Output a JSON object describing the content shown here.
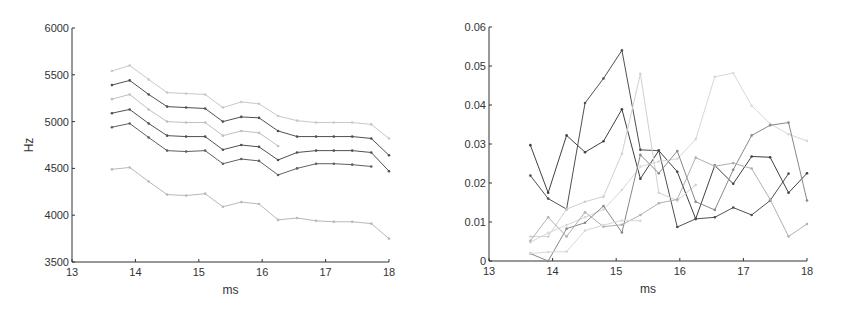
{
  "chart_data": [
    {
      "type": "line",
      "title": "",
      "xlabel": "ms",
      "ylabel": "Hz",
      "xlim": [
        13,
        18
      ],
      "ylim": [
        3500,
        6000
      ],
      "xticks": [
        13,
        14,
        15,
        16,
        17,
        18
      ],
      "yticks": [
        3500,
        4000,
        4500,
        5000,
        5500,
        6000
      ],
      "grid": false,
      "legend": null,
      "x": [
        13.63,
        13.91,
        14.21,
        14.5,
        14.8,
        15.1,
        15.38,
        15.67,
        15.95,
        16.25,
        16.55,
        16.85,
        17.13,
        17.42,
        17.72,
        18.0
      ],
      "series": [
        {
          "name": "series-1",
          "color": "#c8c8c8",
          "values": [
            5540,
            5600,
            5450,
            5310,
            5300,
            5290,
            5150,
            5210,
            5190,
            5060,
            5010,
            4990,
            4990,
            4990,
            4970,
            4820
          ]
        },
        {
          "name": "series-2",
          "color": "#505050",
          "values": [
            5390,
            5440,
            5290,
            5160,
            5150,
            5140,
            5000,
            5050,
            5040,
            4900,
            4840,
            4840,
            4840,
            4840,
            4820,
            4640
          ]
        },
        {
          "name": "series-3",
          "color": "#c0c0c0",
          "values": [
            5240,
            5290,
            5130,
            5000,
            4990,
            4990,
            4850,
            4900,
            4880,
            4740,
            null,
            null,
            null,
            null,
            null,
            null
          ]
        },
        {
          "name": "series-4",
          "color": "#505050",
          "values": [
            5090,
            5130,
            4980,
            4850,
            4840,
            4840,
            4700,
            4750,
            4730,
            4590,
            4670,
            4690,
            4690,
            4690,
            4670,
            4470
          ]
        },
        {
          "name": "series-5",
          "color": "#606060",
          "values": [
            4940,
            4980,
            4830,
            4690,
            4680,
            4690,
            4550,
            4600,
            4580,
            4430,
            4500,
            4550,
            4550,
            4540,
            4520,
            null
          ]
        },
        {
          "name": "series-6",
          "color": "#b8b8b8",
          "values": [
            4490,
            4510,
            4360,
            4220,
            4210,
            4230,
            4090,
            4140,
            4120,
            3950,
            3970,
            3940,
            3930,
            3930,
            3910,
            3750
          ]
        }
      ]
    },
    {
      "type": "line",
      "title": "",
      "xlabel": "ms",
      "ylabel": "",
      "xlim": [
        13,
        18
      ],
      "ylim": [
        0,
        0.06
      ],
      "xticks": [
        13,
        14,
        15,
        16,
        17,
        18
      ],
      "yticks": [
        0,
        0.01,
        0.02,
        0.03,
        0.04,
        0.05,
        0.06
      ],
      "ytick_labels": [
        "0",
        "0.01",
        "0.02",
        "0.03",
        "0.04",
        "0.05",
        "0.06"
      ],
      "grid": false,
      "legend": null,
      "x": [
        13.65,
        13.93,
        14.22,
        14.51,
        14.8,
        15.09,
        15.38,
        15.67,
        15.96,
        16.25,
        16.55,
        16.84,
        17.13,
        17.42,
        17.71,
        18.0
      ],
      "series": [
        {
          "name": "series-1",
          "color": "#404040",
          "values": [
            0.0297,
            0.0175,
            0.0322,
            0.0279,
            0.0307,
            0.0389,
            0.0211,
            0.0283,
            0.0229,
            0.0108,
            0.0245,
            0.0198,
            0.0268,
            0.0266,
            0.0175,
            0.0225
          ]
        },
        {
          "name": "series-2",
          "color": "#505050",
          "values": [
            0.0219,
            0.016,
            0.0133,
            0.0405,
            0.0468,
            0.054,
            0.0285,
            0.0283,
            0.0087,
            0.0108,
            0.0112,
            0.0137,
            0.0118,
            0.0155,
            0.0224,
            null
          ]
        },
        {
          "name": "series-3",
          "color": "#d0d0d0",
          "values": [
            0.0063,
            0.0063,
            0.0133,
            0.0152,
            0.0165,
            0.0275,
            0.048,
            0.0175,
            0.0155,
            0.0195,
            null,
            null,
            null,
            null,
            null,
            null
          ]
        },
        {
          "name": "series-4",
          "color": "#d8d8d8",
          "values": [
            0.0048,
            0.0072,
            0.0092,
            0.0112,
            0.0132,
            0.0182,
            0.0242,
            0.0255,
            0.0262,
            0.0312,
            0.0472,
            0.0482,
            0.0398,
            0.0352,
            0.0325,
            0.0308
          ]
        },
        {
          "name": "series-5",
          "color": "#888888",
          "values": [
            0.0019,
            0.0,
            0.0083,
            0.0098,
            0.0141,
            0.0073,
            0.0272,
            0.0225,
            0.0282,
            0.0152,
            0.0131,
            0.0234,
            0.0322,
            0.0348,
            0.0355,
            0.0155
          ]
        },
        {
          "name": "series-6",
          "color": "#b0b0b0",
          "values": [
            0.0052,
            0.0112,
            0.0063,
            0.0125,
            0.0088,
            0.0093,
            0.0118,
            0.0148,
            0.0158,
            0.0265,
            0.0243,
            0.0251,
            0.0237,
            0.0158,
            0.0063,
            0.0095
          ]
        },
        {
          "name": "series-7",
          "color": "#d8d8d8",
          "values": [
            0.0019,
            0.0023,
            0.0024,
            0.0078,
            0.0092,
            0.0104,
            0.0103,
            null,
            null,
            null,
            null,
            null,
            null,
            null,
            null,
            null
          ]
        }
      ]
    }
  ]
}
